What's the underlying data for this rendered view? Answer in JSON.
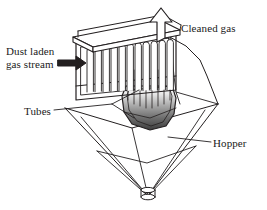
{
  "figure": {
    "kind": "process-equipment-line-diagram",
    "background_color": "#ffffff",
    "line_color": "#231f20",
    "shade_dark": "#4d4d4d",
    "shade_mid": "#9a9a9a",
    "shade_light": "#ffffff"
  },
  "labels": {
    "dust_inlet": "Dust laden\ngas stream",
    "cleaned_gas": "Cleaned gas",
    "tubes": "Tubes",
    "hopper": "Hopper"
  },
  "icons": {
    "inlet_arrow": "solid-right-arrow",
    "outlet_arrow": "hollow-up-arrow"
  },
  "components": [
    {
      "name": "clean-gas-plenum-lid",
      "description": "slanted flat cover plate on top of the tube housing"
    },
    {
      "name": "tube-housing",
      "description": "open rectangular chamber in perspective holding the tube bundle"
    },
    {
      "name": "tube-bundle",
      "description": "row of vertical round-topped filter tubes",
      "count": 12
    },
    {
      "name": "hopper-cone",
      "description": "inverted cone collecting separated dust"
    },
    {
      "name": "hopper-band",
      "description": "horizontal stiffening ring around the cone"
    },
    {
      "name": "discharge-nozzle",
      "description": "small cylindrical outlet at the cone apex"
    }
  ]
}
